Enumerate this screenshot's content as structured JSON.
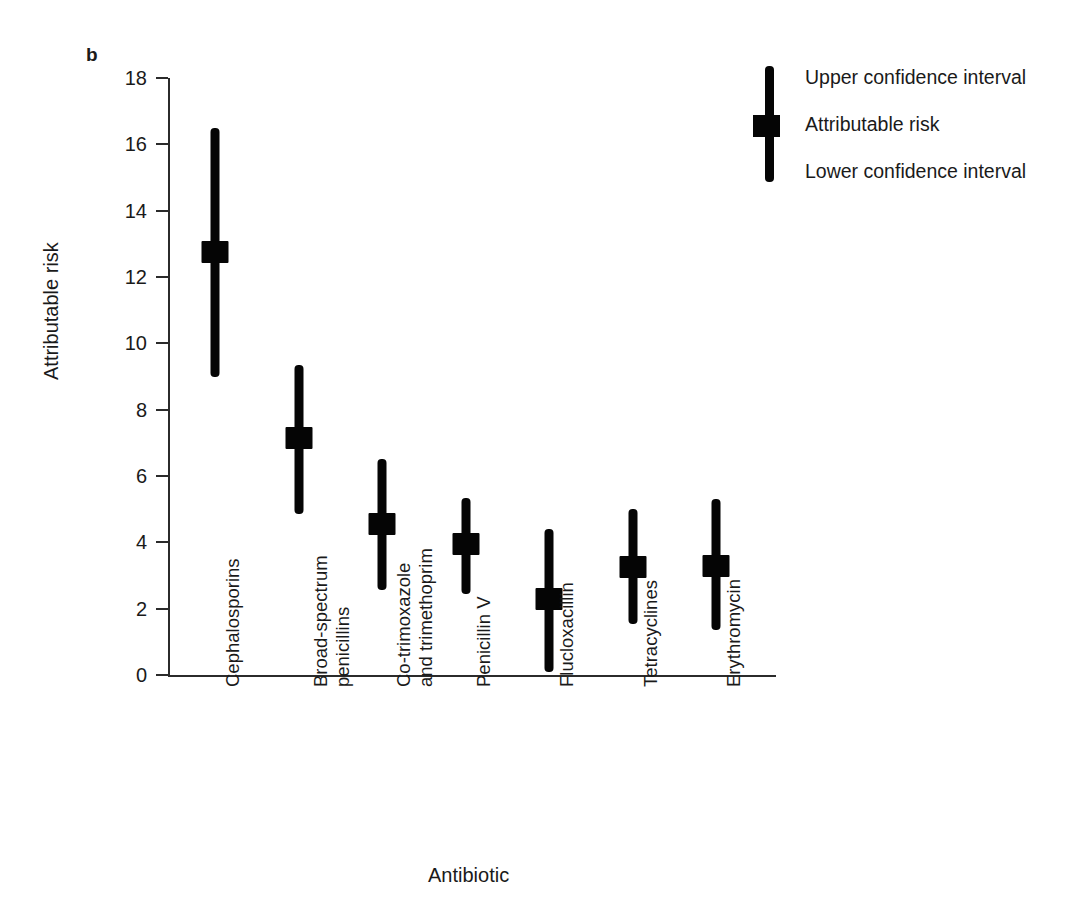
{
  "panel": {
    "label": "b"
  },
  "chart_data": {
    "type": "scatter",
    "title": "",
    "xlabel": "Antibiotic",
    "ylabel": "Attributable risk",
    "ylim": [
      0,
      18
    ],
    "yticks": [
      0,
      2,
      4,
      6,
      8,
      10,
      12,
      14,
      16,
      18
    ],
    "ytick_labels": [
      "0",
      "2",
      "4",
      "6",
      "8",
      "10",
      "12",
      "14",
      "16",
      "18"
    ],
    "grid": false,
    "legend_position": "top-right",
    "categories": [
      "Cephalosporins",
      "Broad-spectrum penicillins",
      "Co-trimoxazole and trimethoprim",
      "Penicillin V",
      "Flucloxacillin",
      "Tetracyclines",
      "Erythromycin"
    ],
    "category_label_lines": [
      [
        "Cephalosporins"
      ],
      [
        "Broad-spectrum",
        "penicillins"
      ],
      [
        "Co-trimoxazole",
        "and trimethoprim"
      ],
      [
        "Penicillin V"
      ],
      [
        "Flucloxacillin"
      ],
      [
        "Tetracyclines"
      ],
      [
        "Erythromycin"
      ]
    ],
    "series": [
      {
        "name": "Attributable risk",
        "values": [
          12.75,
          7.15,
          4.55,
          3.95,
          2.3,
          3.25,
          3.3
        ]
      },
      {
        "name": "Upper confidence interval",
        "values": [
          16.5,
          9.35,
          6.5,
          5.35,
          4.4,
          5.0,
          5.3
        ]
      },
      {
        "name": "Lower confidence interval",
        "values": [
          9.0,
          4.85,
          2.55,
          2.45,
          0.1,
          1.55,
          1.35
        ]
      }
    ],
    "marker_color": "#050505",
    "bar_color": "#050505",
    "axis_color": "#2b2b2b"
  },
  "legend": {
    "entries": [
      "Upper confidence interval",
      "Attributable risk",
      "Lower confidence interval"
    ]
  }
}
